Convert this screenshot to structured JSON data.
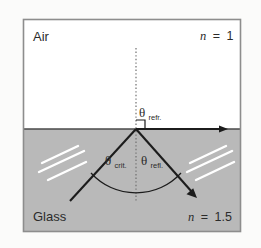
{
  "figure": {
    "colors": {
      "page_background": "#fbfbfa",
      "frame_border": "#8d8d8d",
      "air_fill": "#ffffff",
      "glass_fill": "#b9b9b9",
      "ray_stroke": "#1c1c1c",
      "normal_dotted": "#6f6f6f",
      "hatch_stroke": "#ffffff",
      "text": "#2b2b2b"
    },
    "regions": [
      {
        "name": "air",
        "label": "Air",
        "index_label": "n = 1",
        "index_symbol": "n",
        "index_equals": "=",
        "index_value": "1"
      },
      {
        "name": "glass",
        "label": "Glass",
        "index_label": "n = 1.5",
        "index_symbol": "n",
        "index_equals": "=",
        "index_value": "1.5"
      }
    ],
    "angles": [
      {
        "name": "refracted",
        "symbol": "θ",
        "subscript": "refr.",
        "full_label": "θrefr."
      },
      {
        "name": "critical",
        "symbol": "θ",
        "subscript": "crit.",
        "full_label": "θcrit."
      },
      {
        "name": "reflected",
        "symbol": "θ",
        "subscript": "refl.",
        "full_label": "θrefl."
      }
    ],
    "geometry": {
      "frame": {
        "x": 23,
        "y": 19,
        "w": 218,
        "h": 213
      },
      "interface_y": 129,
      "vertex": {
        "x": 136,
        "y": 129
      },
      "normal_top_y": 48,
      "normal_bottom_y": 201,
      "refracted_ray_end": {
        "x": 228,
        "y": 129
      },
      "incident_ray_start": {
        "x": 70,
        "y": 201
      },
      "reflected_ray_end": {
        "x": 197,
        "y": 198
      },
      "arc_radius": 61,
      "right_angle_marker_size": 9
    }
  }
}
